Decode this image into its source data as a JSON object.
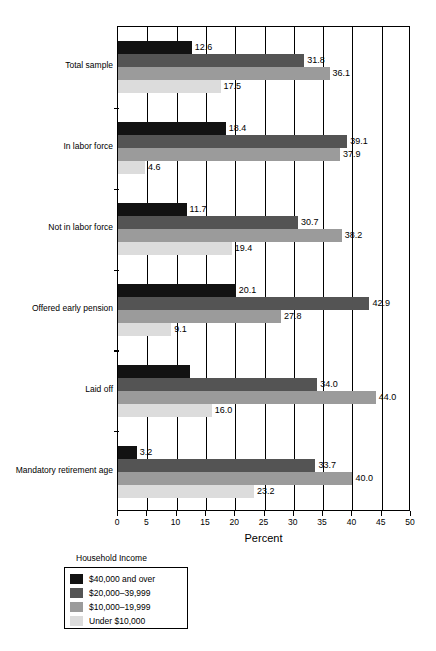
{
  "chart_data": {
    "type": "bar",
    "orientation": "horizontal",
    "title": "",
    "xlabel": "Percent",
    "ylabel": "",
    "xlim": [
      0,
      50
    ],
    "xticks": [
      0,
      5,
      10,
      15,
      20,
      25,
      30,
      35,
      40,
      45,
      50
    ],
    "xtick_labels": [
      "0",
      "5",
      "10",
      "15",
      "20",
      "25",
      "30",
      "35",
      "40",
      "45",
      "50"
    ],
    "grid": true,
    "grid_axis": "x",
    "legend_title": "Household Income",
    "legend_position": "below-left",
    "categories": [
      "Total sample",
      "In labor force",
      "Not in labor force",
      "Offered early pension",
      "Laid off",
      "Mandatory retirement age"
    ],
    "series": [
      {
        "name": "$40,000 and over",
        "color": "#121212",
        "values": [
          12.6,
          18.4,
          11.7,
          20.1,
          12.3,
          3.2
        ],
        "labels": [
          "12.6",
          "18.4",
          "11.7",
          "20.1",
          "",
          "3.2"
        ]
      },
      {
        "name": "$20,000–39,999",
        "color": "#545454",
        "values": [
          31.8,
          39.1,
          30.7,
          42.9,
          34.0,
          33.7
        ],
        "labels": [
          "31.8",
          "39.1",
          "30.7",
          "42.9",
          "34.0",
          "33.7"
        ]
      },
      {
        "name": "$10,000–19,999",
        "color": "#9b9b9b",
        "values": [
          36.1,
          37.9,
          38.2,
          27.8,
          44.0,
          40.0
        ],
        "labels": [
          "36.1",
          "37.9",
          "38.2",
          "27.8",
          "44.0",
          "40.0"
        ]
      },
      {
        "name": "Under $10,000",
        "color": "#dcdcdc",
        "values": [
          17.5,
          4.6,
          19.4,
          9.1,
          16.0,
          23.2
        ],
        "labels": [
          "17.5",
          "4.6",
          "19.4",
          "9.1",
          "16.0",
          "23.2"
        ]
      }
    ]
  }
}
